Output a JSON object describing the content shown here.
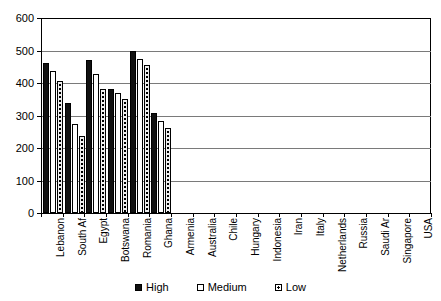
{
  "chart_data": {
    "type": "bar",
    "title": "",
    "xlabel": "",
    "ylabel": "",
    "ylim": [
      0,
      600
    ],
    "ytick_step": 100,
    "yticks": [
      0,
      100,
      200,
      300,
      400,
      500,
      600
    ],
    "grid": true,
    "legend_position": "bottom",
    "categories": [
      "Lebanon",
      "South Af",
      "Egypt",
      "Botswana",
      "Romania",
      "Ghana",
      "Armenia",
      "Australia",
      "Chile",
      "Hungary",
      "Indonesia",
      "Iran",
      "Italy",
      "Netherlands",
      "Russia",
      "Saudi Ar",
      "Singapore",
      "USA"
    ],
    "series": [
      {
        "name": "High",
        "fill": "solid-black",
        "values": [
          463,
          340,
          472,
          383,
          497,
          309,
          null,
          null,
          null,
          null,
          null,
          null,
          null,
          null,
          null,
          null,
          null,
          null
        ]
      },
      {
        "name": "Medium",
        "fill": "white",
        "values": [
          438,
          275,
          429,
          370,
          475,
          284,
          null,
          null,
          null,
          null,
          null,
          null,
          null,
          null,
          null,
          null,
          null,
          null
        ]
      },
      {
        "name": "Low",
        "fill": "dotted",
        "values": [
          407,
          238,
          383,
          352,
          454,
          262,
          null,
          null,
          null,
          null,
          null,
          null,
          null,
          null,
          null,
          null,
          null,
          null
        ]
      }
    ]
  },
  "colors": {
    "high": "#111111",
    "medium": "#ffffff",
    "low": "#efefef",
    "grid": "#7a7a7a",
    "axis": "#000000",
    "background": "#ffffff"
  }
}
